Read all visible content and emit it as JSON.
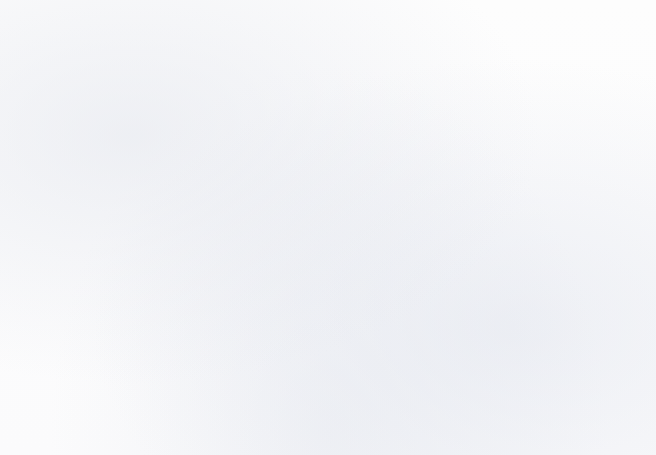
{
  "chart_data": {
    "type": "bar",
    "title": "Favorite color",
    "xlabel": "",
    "ylabel": "How many people like it",
    "categories": [
      "Blue",
      "Green",
      "Red",
      "Purple",
      "Black"
    ],
    "values": [
      30,
      17,
      13,
      12,
      9.7
    ],
    "ylim": [
      0,
      35
    ],
    "ytick_labels": [
      "0",
      "5",
      "10",
      "15",
      "20",
      "25",
      "30",
      "35"
    ],
    "ytick_values": [
      0,
      5,
      10,
      15,
      20,
      25,
      30,
      35
    ],
    "y_major_step": 5,
    "y_minor_step": 1,
    "grid": "horizontal",
    "legend": "none",
    "series": [
      {
        "name": "How many people like it",
        "values": [
          30,
          17,
          13,
          12,
          9.7
        ]
      }
    ]
  },
  "style": {
    "bar_fill": "#9a97d2",
    "bar_border": "#2b2b2b",
    "axis_color": "#2b2b2b",
    "major_gridline": "#3a3a3a",
    "minor_gridline": "#5a5f6e",
    "text_color": "#111111",
    "page_background": "#fdfdfd"
  }
}
